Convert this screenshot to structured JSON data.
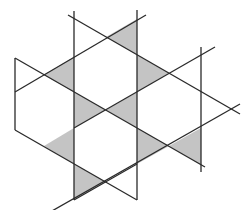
{
  "diagram": {
    "title": "",
    "colors": {
      "background": "#ffffff",
      "line": "#2a2a2a",
      "shade": "#c4c4c4"
    },
    "lines": [
      {
        "id": "v-left",
        "x1": 15,
        "y1": 58,
        "x2": 15,
        "y2": 130
      },
      {
        "id": "v-inner-left",
        "x1": 74,
        "y1": 11,
        "x2": 74,
        "y2": 200
      },
      {
        "id": "v-inner-right",
        "x1": 137,
        "y1": 10,
        "x2": 137,
        "y2": 200
      },
      {
        "id": "v-right",
        "x1": 201,
        "y1": 47,
        "x2": 201,
        "y2": 172
      },
      {
        "id": "d-top-down-right",
        "x1": 68,
        "y1": 15,
        "x2": 240,
        "y2": 114
      },
      {
        "id": "d-top-down-left",
        "x1": 146,
        "y1": 15,
        "x2": 15,
        "y2": 92
      },
      {
        "id": "d-left-down-right",
        "x1": 15,
        "y1": 58,
        "x2": 205,
        "y2": 167
      },
      {
        "id": "d-right-down-left",
        "x1": 215,
        "y1": 47,
        "x2": 74,
        "y2": 128
      },
      {
        "id": "d-far-right-down-left",
        "x1": 240,
        "y1": 104,
        "x2": 15,
        "y2": 232
      },
      {
        "id": "d-left-lower",
        "x1": 15,
        "y1": 130,
        "x2": 137,
        "y2": 200
      },
      {
        "id": "d-bottom-up-right",
        "x1": 74,
        "y1": 200,
        "x2": 137,
        "y2": 164
      }
    ],
    "shaded_triangles": [
      {
        "id": "tri-top-right",
        "points": "106,37 137,19 137,55"
      },
      {
        "id": "tri-upper-left",
        "points": "44,75 74,57 74,92"
      },
      {
        "id": "tri-upper-right",
        "points": "137,55 169,73 137,92"
      },
      {
        "id": "tri-center-left",
        "points": "74,92 106,110 74,128"
      },
      {
        "id": "tri-center-right",
        "points": "137,92 106,110 137,128"
      },
      {
        "id": "tri-lower-left",
        "points": "74,128 44,146 74,164"
      },
      {
        "id": "tri-lower-right",
        "points": "137,128 169,146 137,164"
      },
      {
        "id": "tri-right",
        "points": "169,146 201,128 201,165"
      },
      {
        "id": "tri-bottom",
        "points": "74,164 106,182 74,200"
      },
      {
        "id": "tri-left-top-small",
        "points": "74,57 74,92 44,75"
      }
    ]
  }
}
